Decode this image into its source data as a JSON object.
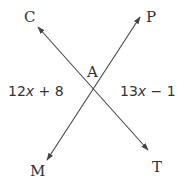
{
  "diagram": {
    "type": "intersecting-lines",
    "intersection": {
      "label": "A",
      "x": 93,
      "y": 88
    },
    "lines": [
      {
        "name": "line-CT",
        "from": "C",
        "to": "T",
        "x1": 38,
        "y1": 27,
        "x2": 148,
        "y2": 150
      },
      {
        "name": "line-PM",
        "from": "P",
        "to": "M",
        "x1": 140,
        "y1": 17,
        "x2": 47,
        "y2": 160
      }
    ],
    "points": {
      "C": {
        "label": "C",
        "x": 24,
        "y": 22
      },
      "P": {
        "label": "P",
        "x": 146,
        "y": 22
      },
      "M": {
        "label": "M",
        "x": 30,
        "y": 176
      },
      "T": {
        "label": "T",
        "x": 152,
        "y": 172
      },
      "A": {
        "label": "A",
        "x": 88,
        "y": 77
      }
    },
    "angles": {
      "left": {
        "coef": "12",
        "var": "x",
        "rest": " + 8",
        "full": "12x + 8"
      },
      "right": {
        "coef": "13",
        "var": "x",
        "rest": " − 1",
        "full": "13x − 1"
      }
    },
    "colors": {
      "stroke": "#444444",
      "text": "#333333",
      "background": "#ffffff"
    }
  }
}
